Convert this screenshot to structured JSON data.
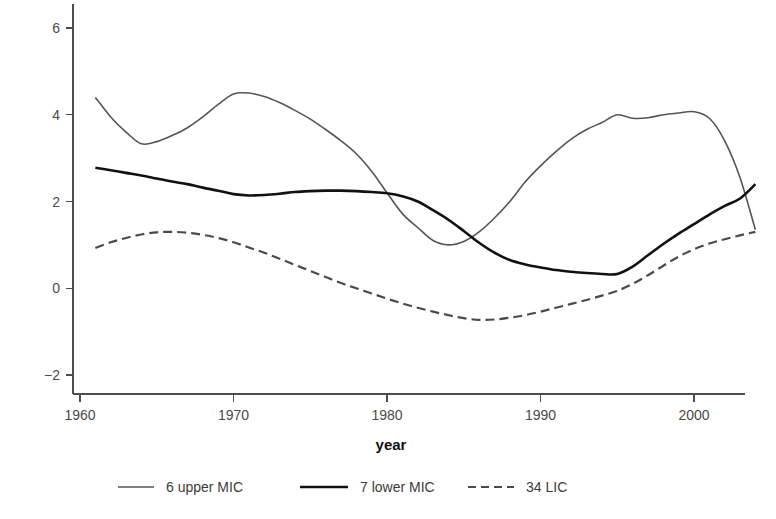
{
  "chart_data": {
    "type": "line",
    "title": "",
    "subtitle": "",
    "xlabel": "year",
    "ylabel": "",
    "xlim": [
      1960,
      2005
    ],
    "ylim": [
      -2.6,
      6.5
    ],
    "grid": false,
    "legend_position": "bottom",
    "x_ticks": [
      1960,
      1970,
      1980,
      1990,
      2000
    ],
    "x_tick_labels": [
      "1960",
      "1970",
      "1980",
      "1990",
      "2000"
    ],
    "y_ticks": [
      -2,
      0,
      2,
      4,
      6
    ],
    "y_tick_labels": [
      "−2",
      "0",
      "2",
      "4",
      "6"
    ],
    "x": [
      1961,
      1962,
      1963,
      1964,
      1965,
      1966,
      1967,
      1968,
      1969,
      1970,
      1971,
      1972,
      1973,
      1974,
      1975,
      1976,
      1977,
      1978,
      1979,
      1980,
      1981,
      1982,
      1983,
      1984,
      1985,
      1986,
      1987,
      1988,
      1989,
      1990,
      1991,
      1992,
      1993,
      1994,
      1995,
      1996,
      1997,
      1998,
      1999,
      2000,
      2001,
      2002,
      2003,
      2004
    ],
    "series": [
      {
        "name": "6 upper MIC",
        "color": "#555555",
        "linestyle": "solid",
        "linewidth": 1.6,
        "values": [
          4.4,
          3.95,
          3.6,
          3.33,
          3.38,
          3.52,
          3.7,
          3.95,
          4.24,
          4.48,
          4.5,
          4.42,
          4.28,
          4.1,
          3.9,
          3.66,
          3.4,
          3.1,
          2.7,
          2.2,
          1.72,
          1.4,
          1.1,
          1.0,
          1.08,
          1.3,
          1.62,
          2.0,
          2.45,
          2.82,
          3.15,
          3.44,
          3.66,
          3.82,
          4.0,
          3.92,
          3.93,
          4.0,
          4.04,
          4.07,
          3.92,
          3.4,
          2.55,
          1.35
        ]
      },
      {
        "name": "7 lower MIC",
        "color": "#111111",
        "linestyle": "solid",
        "linewidth": 2.6,
        "values": [
          2.78,
          2.72,
          2.66,
          2.6,
          2.53,
          2.46,
          2.4,
          2.32,
          2.25,
          2.17,
          2.14,
          2.15,
          2.18,
          2.22,
          2.24,
          2.25,
          2.25,
          2.24,
          2.22,
          2.19,
          2.12,
          2.0,
          1.8,
          1.58,
          1.32,
          1.05,
          0.82,
          0.65,
          0.55,
          0.48,
          0.42,
          0.38,
          0.35,
          0.33,
          0.33,
          0.5,
          0.76,
          1.02,
          1.26,
          1.48,
          1.7,
          1.9,
          2.07,
          2.4
        ]
      },
      {
        "name": "34 LIC",
        "color": "#4a4a4a",
        "linestyle": "dashed",
        "linewidth": 2.2,
        "values": [
          0.93,
          1.06,
          1.16,
          1.24,
          1.29,
          1.3,
          1.28,
          1.23,
          1.16,
          1.06,
          0.94,
          0.82,
          0.68,
          0.54,
          0.4,
          0.26,
          0.12,
          0.0,
          -0.12,
          -0.24,
          -0.35,
          -0.45,
          -0.54,
          -0.62,
          -0.69,
          -0.73,
          -0.72,
          -0.68,
          -0.62,
          -0.54,
          -0.45,
          -0.36,
          -0.27,
          -0.17,
          -0.06,
          0.1,
          0.3,
          0.52,
          0.73,
          0.9,
          1.03,
          1.13,
          1.22,
          1.3
        ]
      }
    ],
    "legend": [
      {
        "label": "6 upper MIC",
        "color": "#555555",
        "linestyle": "solid",
        "linewidth": 1.6
      },
      {
        "label": "7 lower MIC",
        "color": "#111111",
        "linestyle": "solid",
        "linewidth": 2.6
      },
      {
        "label": "34 LIC",
        "color": "#4a4a4a",
        "linestyle": "dashed",
        "linewidth": 2.2
      }
    ]
  }
}
